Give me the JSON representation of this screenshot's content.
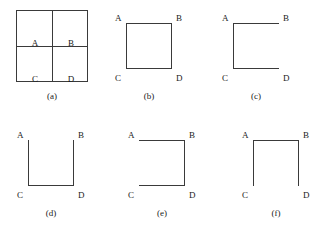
{
  "figure": {
    "background_color": "#ffffff",
    "line_color": "#3a3a3a",
    "text_color": "#1a1a1a",
    "vertex_labels": {
      "top_left": "A",
      "top_right": "B",
      "bottom_left": "C",
      "bottom_right": "D"
    },
    "panels": [
      {
        "id": "a",
        "caption": "(a)",
        "type": "grid",
        "description": "2x2 grid of four cells",
        "cells": [
          {
            "label": "A",
            "position": "top-left"
          },
          {
            "label": "B",
            "position": "top-right"
          },
          {
            "label": "C",
            "position": "bottom-left"
          },
          {
            "label": "D",
            "position": "bottom-right"
          }
        ],
        "edges": {
          "top": true,
          "right": true,
          "bottom": true,
          "left": true
        },
        "internal_lines": {
          "vertical": true,
          "horizontal": true
        }
      },
      {
        "id": "b",
        "caption": "(b)",
        "type": "square",
        "description": "complete square, all four edges present",
        "edges": {
          "top": true,
          "right": true,
          "bottom": true,
          "left": true
        },
        "missing_edge": "none"
      },
      {
        "id": "c",
        "caption": "(c)",
        "type": "square",
        "description": "top, left and bottom edges; right edge missing",
        "edges": {
          "top": true,
          "right": false,
          "bottom": true,
          "left": true
        },
        "missing_edge": "right"
      },
      {
        "id": "d",
        "caption": "(d)",
        "type": "square",
        "description": "left, bottom and right edges; top edge missing (U shape)",
        "edges": {
          "top": false,
          "right": true,
          "bottom": true,
          "left": true
        },
        "missing_edge": "top"
      },
      {
        "id": "e",
        "caption": "(e)",
        "type": "square",
        "description": "top, right and bottom edges; left edge missing",
        "edges": {
          "top": true,
          "right": true,
          "bottom": true,
          "left": false
        },
        "missing_edge": "left"
      },
      {
        "id": "f",
        "caption": "(f)",
        "type": "square",
        "description": "top, left and right edges; bottom edge missing (inverted U)",
        "edges": {
          "top": true,
          "right": true,
          "bottom": false,
          "left": true
        },
        "missing_edge": "bottom"
      }
    ]
  }
}
